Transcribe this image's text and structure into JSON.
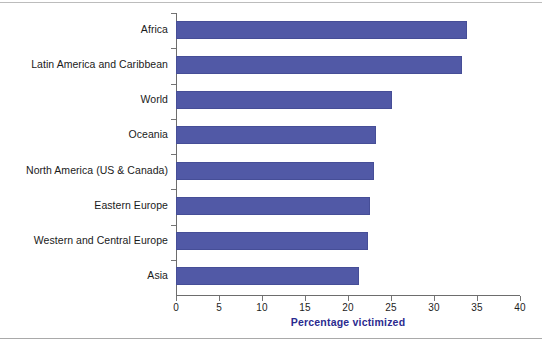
{
  "chart_data": {
    "type": "bar",
    "orientation": "horizontal",
    "title": "",
    "xlabel": "Percentage victimized",
    "ylabel": "",
    "xlim": [
      0,
      40
    ],
    "xticks": [
      0,
      5,
      10,
      15,
      20,
      25,
      30,
      35,
      40
    ],
    "grid": false,
    "legend": null,
    "series_color": "#5159a6",
    "axis_title_color": "#2b2b8f",
    "categories": [
      "Africa",
      "Latin America and Caribbean",
      "World",
      "Oceania",
      "North America (US & Canada)",
      "Eastern Europe",
      "Western and Central Europe",
      "Asia"
    ],
    "values": [
      33.8,
      33.2,
      25.1,
      23.2,
      23.0,
      22.5,
      22.3,
      21.3
    ]
  }
}
